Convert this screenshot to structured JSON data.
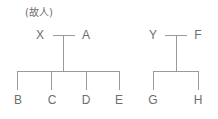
{
  "diagram": {
    "type": "family-tree",
    "note": "(故人)",
    "colors": {
      "line": "#9a9a9a",
      "text": "#6e6e6e"
    },
    "families": [
      {
        "parents": [
          "X",
          "A"
        ],
        "children": [
          "B",
          "C",
          "D",
          "E"
        ]
      },
      {
        "parents": [
          "Y",
          "F"
        ],
        "children": [
          "G",
          "H"
        ]
      }
    ]
  }
}
